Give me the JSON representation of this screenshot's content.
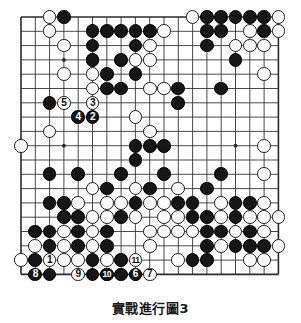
{
  "figure": {
    "caption": "實戰進行圖3",
    "kind": "go-game-record",
    "board_size": 19
  },
  "colors": {
    "background": "#ffffff",
    "grid_line": "#2b2b2b",
    "board_border": "#1a1a1a",
    "black_stone": "#161616",
    "white_stone": "#fdfdfd",
    "black_label": "#ffffff",
    "white_label": "#111111"
  },
  "board": {
    "size": 19,
    "origin_x": 11,
    "origin_y": 11,
    "spacing": 14.3,
    "star_points": [
      [
        3,
        3
      ],
      [
        9,
        3
      ],
      [
        15,
        3
      ],
      [
        3,
        9
      ],
      [
        9,
        9
      ],
      [
        15,
        9
      ],
      [
        3,
        15
      ],
      [
        9,
        15
      ],
      [
        15,
        15
      ]
    ],
    "black_stones": [
      [
        3,
        0
      ],
      [
        5,
        1
      ],
      [
        6,
        1
      ],
      [
        7,
        1
      ],
      [
        8,
        1
      ],
      [
        9,
        1
      ],
      [
        13,
        0
      ],
      [
        14,
        0
      ],
      [
        15,
        0
      ],
      [
        16,
        0
      ],
      [
        17,
        0
      ],
      [
        13,
        1
      ],
      [
        14,
        1
      ],
      [
        17,
        1
      ],
      [
        5,
        2
      ],
      [
        8,
        2
      ],
      [
        13,
        2
      ],
      [
        5,
        3
      ],
      [
        7,
        3
      ],
      [
        15,
        3
      ],
      [
        6,
        4
      ],
      [
        8,
        4
      ],
      [
        6,
        5
      ],
      [
        7,
        5
      ],
      [
        11,
        5
      ],
      [
        14,
        5
      ],
      [
        2,
        6
      ],
      [
        11,
        6
      ],
      [
        4,
        7
      ],
      [
        5,
        7
      ],
      [
        8,
        9
      ],
      [
        9,
        9
      ],
      [
        10,
        9
      ],
      [
        8,
        10
      ],
      [
        2,
        11
      ],
      [
        4,
        11
      ],
      [
        7,
        11
      ],
      [
        10,
        11
      ],
      [
        14,
        11
      ],
      [
        6,
        12
      ],
      [
        9,
        12
      ],
      [
        13,
        12
      ],
      [
        2,
        13
      ],
      [
        3,
        13
      ],
      [
        8,
        13
      ],
      [
        11,
        13
      ],
      [
        12,
        13
      ],
      [
        15,
        13
      ],
      [
        16,
        13
      ],
      [
        3,
        14
      ],
      [
        4,
        14
      ],
      [
        7,
        14
      ],
      [
        12,
        14
      ],
      [
        13,
        14
      ],
      [
        15,
        14
      ],
      [
        1,
        15
      ],
      [
        2,
        15
      ],
      [
        4,
        15
      ],
      [
        6,
        15
      ],
      [
        13,
        15
      ],
      [
        14,
        15
      ],
      [
        16,
        15
      ],
      [
        2,
        16
      ],
      [
        4,
        16
      ],
      [
        6,
        16
      ],
      [
        13,
        16
      ],
      [
        15,
        16
      ],
      [
        16,
        16
      ],
      [
        17,
        16
      ],
      [
        1,
        17
      ],
      [
        5,
        17
      ],
      [
        7,
        17
      ],
      [
        12,
        17
      ],
      [
        13,
        17
      ],
      [
        1,
        18
      ],
      [
        2,
        18
      ],
      [
        5,
        18
      ],
      [
        7,
        18
      ]
    ],
    "white_stones": [
      [
        2,
        0
      ],
      [
        12,
        0
      ],
      [
        18,
        0
      ],
      [
        2,
        1
      ],
      [
        10,
        1
      ],
      [
        16,
        1
      ],
      [
        18,
        1
      ],
      [
        3,
        2
      ],
      [
        9,
        2
      ],
      [
        15,
        2
      ],
      [
        16,
        2
      ],
      [
        17,
        2
      ],
      [
        5,
        3
      ],
      [
        8,
        3
      ],
      [
        9,
        3
      ],
      [
        3,
        4
      ],
      [
        5,
        4
      ],
      [
        17,
        4
      ],
      [
        5,
        5
      ],
      [
        9,
        5
      ],
      [
        10,
        5
      ],
      [
        8,
        7
      ],
      [
        2,
        8
      ],
      [
        9,
        8
      ],
      [
        0,
        9
      ],
      [
        17,
        9
      ],
      [
        17,
        11
      ],
      [
        5,
        12
      ],
      [
        8,
        12
      ],
      [
        11,
        12
      ],
      [
        4,
        13
      ],
      [
        6,
        13
      ],
      [
        7,
        13
      ],
      [
        9,
        13
      ],
      [
        10,
        13
      ],
      [
        14,
        13
      ],
      [
        17,
        13
      ],
      [
        5,
        14
      ],
      [
        6,
        14
      ],
      [
        8,
        14
      ],
      [
        10,
        14
      ],
      [
        11,
        14
      ],
      [
        14,
        14
      ],
      [
        16,
        14
      ],
      [
        17,
        14
      ],
      [
        18,
        14
      ],
      [
        3,
        15
      ],
      [
        5,
        15
      ],
      [
        9,
        15
      ],
      [
        10,
        15
      ],
      [
        11,
        15
      ],
      [
        12,
        15
      ],
      [
        15,
        15
      ],
      [
        17,
        15
      ],
      [
        1,
        16
      ],
      [
        3,
        16
      ],
      [
        5,
        16
      ],
      [
        9,
        16
      ],
      [
        14,
        16
      ],
      [
        18,
        16
      ],
      [
        0,
        17
      ],
      [
        3,
        17
      ],
      [
        4,
        17
      ],
      [
        6,
        17
      ],
      [
        8,
        17
      ],
      [
        11,
        17
      ],
      [
        16,
        17
      ],
      [
        17,
        17
      ],
      [
        4,
        18
      ],
      [
        6,
        18
      ],
      [
        8,
        18
      ]
    ],
    "numbered_moves": [
      {
        "label": "1",
        "color": "white",
        "col": 2,
        "row": 17
      },
      {
        "label": "2",
        "color": "black",
        "col": 5,
        "row": 7
      },
      {
        "label": "3",
        "color": "white",
        "col": 5,
        "row": 6
      },
      {
        "label": "4",
        "color": "black",
        "col": 4,
        "row": 7
      },
      {
        "label": "5",
        "color": "white",
        "col": 3,
        "row": 6
      },
      {
        "label": "6",
        "color": "black",
        "col": 8,
        "row": 18
      },
      {
        "label": "7",
        "color": "white",
        "col": 9,
        "row": 18
      },
      {
        "label": "8",
        "color": "black",
        "col": 1,
        "row": 18
      },
      {
        "label": "9",
        "color": "white",
        "col": 4,
        "row": 18
      },
      {
        "label": "10",
        "color": "black",
        "col": 6,
        "row": 18
      },
      {
        "label": "11",
        "color": "white",
        "col": 8,
        "row": 17
      }
    ]
  }
}
